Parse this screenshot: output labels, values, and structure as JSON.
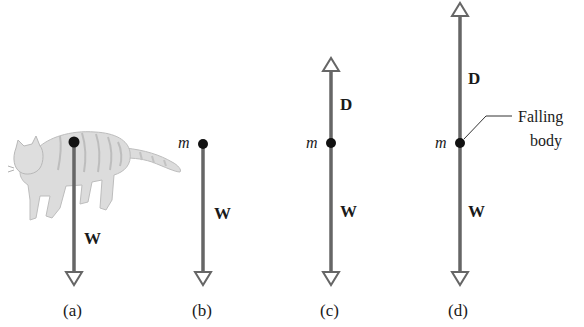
{
  "figure": {
    "colors": {
      "vector": "#666666",
      "dot": "#111111",
      "cat_fill": "#d9d9d9",
      "cat_stripe": "#b5b5b5",
      "text": "#1a1a1a"
    },
    "panels": [
      {
        "id": "a",
        "caption": "(a)",
        "has_cat": true,
        "mass_label": "",
        "forces": [
          {
            "label": "W",
            "direction": "down"
          }
        ]
      },
      {
        "id": "b",
        "caption": "(b)",
        "has_cat": false,
        "mass_label": "m",
        "forces": [
          {
            "label": "W",
            "direction": "down"
          }
        ]
      },
      {
        "id": "c",
        "caption": "(c)",
        "has_cat": false,
        "mass_label": "m",
        "forces": [
          {
            "label": "D",
            "direction": "up"
          },
          {
            "label": "W",
            "direction": "down"
          }
        ]
      },
      {
        "id": "d",
        "caption": "(d)",
        "has_cat": false,
        "mass_label": "m",
        "annotation": {
          "line1": "Falling",
          "line2": "body"
        },
        "forces": [
          {
            "label": "D",
            "direction": "up"
          },
          {
            "label": "W",
            "direction": "down"
          }
        ]
      }
    ]
  }
}
